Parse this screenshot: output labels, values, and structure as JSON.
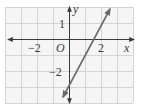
{
  "figure": {
    "type": "coordinate-graph",
    "axis_labels": {
      "x": "x",
      "y": "y"
    },
    "origin_label": "O",
    "tick_labels": {
      "x": [
        {
          "value": -2,
          "text": "−2"
        },
        {
          "value": 2,
          "text": "2"
        }
      ],
      "y": [
        {
          "value": 1,
          "text": "1"
        },
        {
          "value": -2,
          "text": "−2"
        }
      ]
    },
    "grid": {
      "x_range": [
        -4,
        4
      ],
      "y_range": [
        -4,
        2
      ],
      "unit": 1
    },
    "line": {
      "equation": "y = 2x - 3",
      "slope": 2,
      "y_intercept": -3,
      "x_intercept": 1.5,
      "arrows": "both",
      "color": "#6b6b6b"
    },
    "colors": {
      "grid": "#d4d4d4",
      "grid_fill": "#f5f5f5",
      "axis": "#3a3a3a"
    }
  }
}
